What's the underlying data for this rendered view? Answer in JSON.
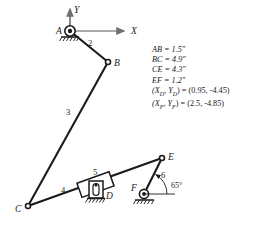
{
  "diagram": {
    "axes": {
      "x_label": "X",
      "y_label": "Y",
      "origin_point": "A",
      "axis_color": "#8c8c8c"
    },
    "joints": [
      {
        "id": "A",
        "label": "A",
        "x": 70,
        "y": 31,
        "type": "ground-pivot"
      },
      {
        "id": "B",
        "label": "B",
        "x": 108,
        "y": 62,
        "type": "pin"
      },
      {
        "id": "C",
        "label": "C",
        "x": 28,
        "y": 206,
        "type": "pin"
      },
      {
        "id": "D",
        "label": "D",
        "x": 96,
        "y": 188,
        "type": "ground-slider"
      },
      {
        "id": "E",
        "label": "E",
        "x": 162,
        "y": 158,
        "type": "pin"
      },
      {
        "id": "F",
        "label": "F",
        "x": 144,
        "y": 194,
        "type": "ground-pivot"
      }
    ],
    "links": [
      {
        "number": "2",
        "label_x": 88,
        "label_y": 43,
        "from": "A",
        "to": "B"
      },
      {
        "number": "3",
        "label_x": 70,
        "label_y": 112,
        "from": "B",
        "to": "C"
      },
      {
        "number": "4",
        "label_x": 64,
        "label_y": 190,
        "from": "C",
        "to": "E"
      },
      {
        "number": "5",
        "label_x": 94,
        "label_y": 172,
        "from": "D",
        "to": "slider"
      },
      {
        "number": "6",
        "label_x": 163,
        "label_y": 175,
        "from": "E",
        "to": "F"
      }
    ],
    "angle": {
      "value": "65°",
      "label_x": 171,
      "label_y": 186,
      "at_joint": "F",
      "between": "link 6 and horizontal"
    },
    "dimensions": [
      {
        "text": "AB = 1.5\""
      },
      {
        "text": "BC = 4.9\""
      },
      {
        "text": "CE = 4.3\""
      },
      {
        "text": "EF = 1.2\""
      }
    ],
    "coordinates": [
      {
        "point": "D",
        "open": "(",
        "x_sym": "X",
        "y_sym": "Y",
        "sub": "D",
        "equals": ") = (",
        "x_val": "0.95",
        "y_val": "-4.45",
        "close": ")"
      },
      {
        "point": "F",
        "open": "(",
        "x_sym": "X",
        "y_sym": "Y",
        "sub": "F",
        "equals": ") = (",
        "x_val": "2.5",
        "y_val": "-4.85",
        "close": ")"
      }
    ],
    "colors": {
      "line": "#1a1a1a",
      "axis": "#8c8c8c",
      "text": "#1a1a1a",
      "background": "#ffffff",
      "hatch": "#2a2a2a"
    }
  }
}
